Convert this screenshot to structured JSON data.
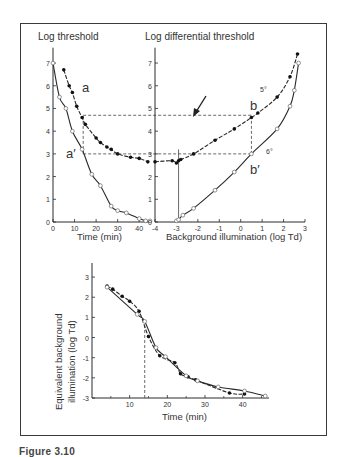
{
  "figure": {
    "caption": "Figure 3.10"
  },
  "chart_data": [
    {
      "type": "scatter",
      "panel": "top-left",
      "title": "Log threshold",
      "xlabel": "Time (min)",
      "ylabel": "Log threshold",
      "xlim": [
        0,
        45
      ],
      "ylim": [
        0,
        7.5
      ],
      "x_ticks": [
        "0",
        "10",
        "20",
        "30",
        "40"
      ],
      "y_ticks": [
        "0",
        "1",
        "2",
        "3",
        "4",
        "5",
        "6",
        "7"
      ],
      "annotations": [
        "a",
        "a'"
      ],
      "series": [
        {
          "name": "a",
          "marker": "filled",
          "x": [
            5,
            7.5,
            9,
            11,
            13.5,
            15,
            20,
            22,
            25,
            27,
            30,
            36,
            40,
            44
          ],
          "y": [
            6.7,
            6.0,
            5.7,
            5.1,
            4.6,
            4.3,
            3.7,
            3.5,
            3.3,
            3.2,
            3.0,
            2.85,
            2.8,
            2.65
          ]
        },
        {
          "name": "a'",
          "marker": "open",
          "x": [
            0,
            3,
            6,
            9,
            13.5,
            18,
            22,
            27,
            30,
            34,
            40,
            43,
            45
          ],
          "y": [
            7.0,
            5.5,
            5.0,
            4.0,
            3.2,
            2.1,
            1.6,
            0.7,
            0.5,
            0.4,
            0.15,
            0.05,
            0.05
          ]
        }
      ],
      "guides": [
        {
          "type": "hline",
          "y": 4.7,
          "from_x": 14,
          "style": "dashed"
        },
        {
          "type": "hline",
          "y": 3.0,
          "from_x": 14,
          "style": "dashed"
        },
        {
          "type": "vline",
          "x": 14,
          "y_range": [
            3.0,
            4.7
          ],
          "style": "dashed"
        }
      ]
    },
    {
      "type": "scatter",
      "panel": "top-right",
      "title": "Log differential threshold",
      "xlabel": "Background illumination (log Td)",
      "ylabel": "Log differential threshold",
      "xlim": [
        -4,
        3
      ],
      "ylim": [
        0,
        7.5
      ],
      "x_ticks": [
        "-4",
        "-3",
        "-2",
        "-1",
        "0",
        "1",
        "2",
        "3"
      ],
      "y_ticks": [
        "0",
        "1",
        "2",
        "3",
        "4",
        "5",
        "6",
        "7"
      ],
      "annotations": [
        "b",
        "b'",
        "5°",
        "6°"
      ],
      "series": [
        {
          "name": "b (5°)",
          "marker": "filled",
          "x": [
            -4,
            -3.2,
            -3,
            -2.9,
            -2.8,
            -2.2,
            -1.2,
            -0.3,
            0.5,
            0.8,
            1.7,
            2.3,
            2.65
          ],
          "y": [
            2.65,
            2.7,
            2.6,
            2.7,
            2.75,
            3.0,
            3.6,
            4.1,
            4.6,
            4.8,
            5.5,
            6.4,
            7.4
          ]
        },
        {
          "name": "b' (6°)",
          "marker": "open",
          "x": [
            -3,
            -2.9,
            -2.7,
            -2.2,
            -1.2,
            -0.3,
            0.5,
            1.7,
            2.3,
            2.5,
            2.7
          ],
          "y": [
            0.05,
            0.1,
            0.3,
            0.6,
            1.4,
            2.2,
            3.0,
            4.1,
            5.1,
            5.8,
            7.0
          ]
        }
      ],
      "guides": [
        {
          "type": "arrow",
          "points_to": [
            -1.85,
            4.7
          ]
        },
        {
          "type": "vline",
          "x": 0.5,
          "y_range": [
            3.0,
            4.7
          ],
          "style": "dashed"
        },
        {
          "type": "vline",
          "x": -2.9,
          "y_range": [
            0,
            3.2
          ],
          "style": "solid"
        }
      ]
    },
    {
      "type": "scatter",
      "panel": "bottom",
      "xlabel": "Time (min)",
      "ylabel": "Equivalent background illumination (log Td)",
      "ylabel_lines": [
        "Equivalent background",
        "illumination (log Td)"
      ],
      "xlim": [
        0,
        47
      ],
      "ylim": [
        -3,
        3.5
      ],
      "x_ticks": [
        "10",
        "20",
        "30",
        "40"
      ],
      "y_ticks": [
        "3",
        "2",
        "1",
        "0",
        "-1",
        "-2",
        "-3"
      ],
      "series": [
        {
          "name": "filled",
          "marker": "filled",
          "x": [
            4,
            5.5,
            8,
            10,
            12.5,
            15,
            18,
            22,
            23.5,
            25.5,
            27.5,
            36.5,
            40.5
          ],
          "y": [
            2.55,
            2.4,
            2.05,
            1.8,
            1.3,
            0.05,
            -0.9,
            -1.25,
            -1.8,
            -1.95,
            -2.1,
            -2.75,
            -2.8
          ]
        },
        {
          "name": "open",
          "marker": "open",
          "x": [
            4,
            12,
            14,
            17,
            19.5,
            25,
            28,
            33.5,
            40.5,
            46
          ],
          "y": [
            2.5,
            1.15,
            0.8,
            -0.5,
            -0.95,
            -1.9,
            -2.15,
            -2.45,
            -2.65,
            -2.9
          ]
        }
      ],
      "guides": [
        {
          "type": "vline",
          "x": 14,
          "y_range": [
            -3,
            0.75
          ],
          "style": "dashed"
        }
      ]
    }
  ],
  "labels": {
    "tl_title": "Log threshold",
    "tr_title": "Log differential threshold",
    "tl_xlabel": "Time (min)",
    "tr_xlabel": "Background illumination (log Td)",
    "bottom_xlabel": "Time (min)",
    "bottom_ylabel_1": "Equivalent background",
    "bottom_ylabel_2": "illumination (log Td)",
    "a": "a",
    "a_prime": "a′",
    "b": "b",
    "b_prime": "b′",
    "deg5": "5°",
    "deg6": "6°"
  }
}
